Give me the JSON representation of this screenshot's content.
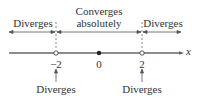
{
  "diagram": {
    "type": "number-line-convergence",
    "regions": [
      {
        "label": "Diverges",
        "range": "x < -2"
      },
      {
        "label_line1": "Converges",
        "label_line2": "absolutely",
        "range": "-2 < x < 2"
      },
      {
        "label": "Diverges",
        "range": "x > 2"
      }
    ],
    "axis_label": "x",
    "ticks": [
      {
        "value": "−2",
        "marker": "open-circle"
      },
      {
        "value": "0",
        "marker": "filled-dot"
      },
      {
        "value": "2",
        "marker": "open-circle"
      }
    ],
    "endpoint_notes": [
      {
        "at": "−2",
        "label": "Diverges"
      },
      {
        "at": "2",
        "label": "Diverges"
      }
    ],
    "colors": {
      "line": "#555555",
      "text": "#333333"
    }
  }
}
